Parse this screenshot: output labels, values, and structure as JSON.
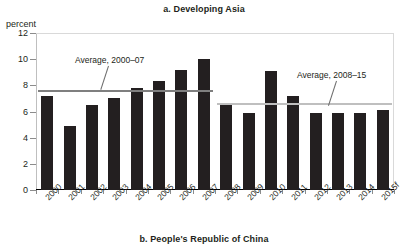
{
  "figure": {
    "panel_title": "a. Developing Asia",
    "panel_caption": "b. People's Republic of China",
    "axis_unit": "percent"
  },
  "annotations": {
    "early": "Average, 2000–07",
    "late": "Average, 2008–15"
  },
  "colors": {
    "bar": "#231f20",
    "avg_early_line": "#7f7f7f",
    "avg_late_line": "#bfbfbf",
    "axis": "#000000",
    "grid": "#d9d9d9",
    "text": "#231f20"
  },
  "chart_data": {
    "type": "bar",
    "title": "a. Developing Asia",
    "subtitle": "b. People's Republic of China",
    "xlabel": "",
    "ylabel": "percent",
    "ylim": [
      0,
      12
    ],
    "yticks": [
      0,
      2,
      4,
      6,
      8,
      10,
      12
    ],
    "ytick_labels": [
      "0",
      "2",
      "4",
      "6",
      "8",
      "10",
      "12"
    ],
    "grid": false,
    "legend": null,
    "categories": [
      "2000",
      "2001",
      "2002",
      "2003",
      "2004",
      "2005",
      "2006",
      "2007",
      "2008",
      "2009",
      "2010",
      "2011",
      "2012",
      "2013",
      "2014",
      "2015f"
    ],
    "values": [
      7.2,
      4.9,
      6.5,
      7.0,
      7.8,
      8.3,
      9.2,
      10.0,
      6.6,
      5.9,
      9.1,
      7.2,
      5.9,
      5.9,
      5.9,
      6.1
    ],
    "reference_lines": [
      {
        "name": "Average, 2000–07",
        "value": 7.6,
        "from_category": "2000",
        "to_category": "2007",
        "color": "#7f7f7f"
      },
      {
        "name": "Average, 2008–15",
        "value": 6.6,
        "from_category": "2008",
        "to_category": "2015f",
        "color": "#bfbfbf"
      }
    ],
    "annotations": [
      {
        "text": "Average, 2000–07",
        "points_to": "Average, 2000–07"
      },
      {
        "text": "Average, 2008–15",
        "points_to": "Average, 2008–15"
      }
    ]
  }
}
